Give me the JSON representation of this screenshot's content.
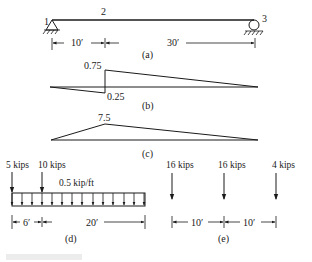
{
  "figure": {
    "a": {
      "caption": "(a)",
      "nodes": [
        {
          "label": "1",
          "support": "pin"
        },
        {
          "label": "2",
          "support": "none"
        },
        {
          "label": "3",
          "support": "roller"
        }
      ],
      "dimensions": [
        "10′",
        "30′"
      ]
    },
    "b": {
      "caption": "(b)",
      "values": {
        "top": "0.75",
        "bottom": "0.25"
      }
    },
    "c": {
      "caption": "(c)",
      "values": {
        "peak": "7.5"
      }
    },
    "d": {
      "caption": "(d)",
      "point_loads": [
        "5 kips",
        "10 kips"
      ],
      "distributed_load": "0.5 kip/ft",
      "dimensions": [
        "6′",
        "20′"
      ]
    },
    "e": {
      "caption": "(e)",
      "point_loads": [
        "16 kips",
        "16 kips",
        "4 kips"
      ],
      "dimensions": [
        "10′",
        "10′"
      ]
    }
  }
}
